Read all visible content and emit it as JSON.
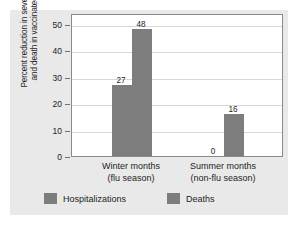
{
  "chart_data": {
    "type": "bar",
    "title": "",
    "subtitle": "",
    "xlabel": "",
    "ylabel": "Percent reduction in severe illness and death in vaccinated group",
    "ylabel_lines": [
      "Percent reduction in severe illness",
      "and death in vaccinated group"
    ],
    "ylim": [
      0,
      54
    ],
    "yticks": [
      0,
      10,
      20,
      30,
      40,
      50
    ],
    "ytick_labels": [
      "0",
      "10",
      "20",
      "30",
      "40",
      "50"
    ],
    "grid": true,
    "grid_axis": "y",
    "legend_position": "bottom",
    "categories": [
      "Winter months (flu season)",
      "Summer months (non-flu season)"
    ],
    "category_lines": [
      [
        "Winter months",
        "(flu season)"
      ],
      [
        "Summer months",
        "(non-flu season)"
      ]
    ],
    "series": [
      {
        "name": "Hospitalizations",
        "values": [
          27,
          0
        ],
        "labels": [
          "27",
          "0"
        ],
        "color": "#7d7d7d"
      },
      {
        "name": "Deaths",
        "values": [
          48,
          16
        ],
        "labels": [
          "48",
          "16"
        ],
        "color": "#7d7d7d"
      }
    ]
  },
  "legend": {
    "items": [
      {
        "label": "Hospitalizations",
        "color": "#7d7d7d"
      },
      {
        "label": "Deaths",
        "color": "#7d7d7d"
      }
    ]
  },
  "colors": {
    "bar": "#7d7d7d",
    "panel_background": "#e9e9e9",
    "plot_background": "#ffffff",
    "axis": "#8a8a8a",
    "gridline": "#d8d8d8",
    "text": "#1d1d1d"
  }
}
